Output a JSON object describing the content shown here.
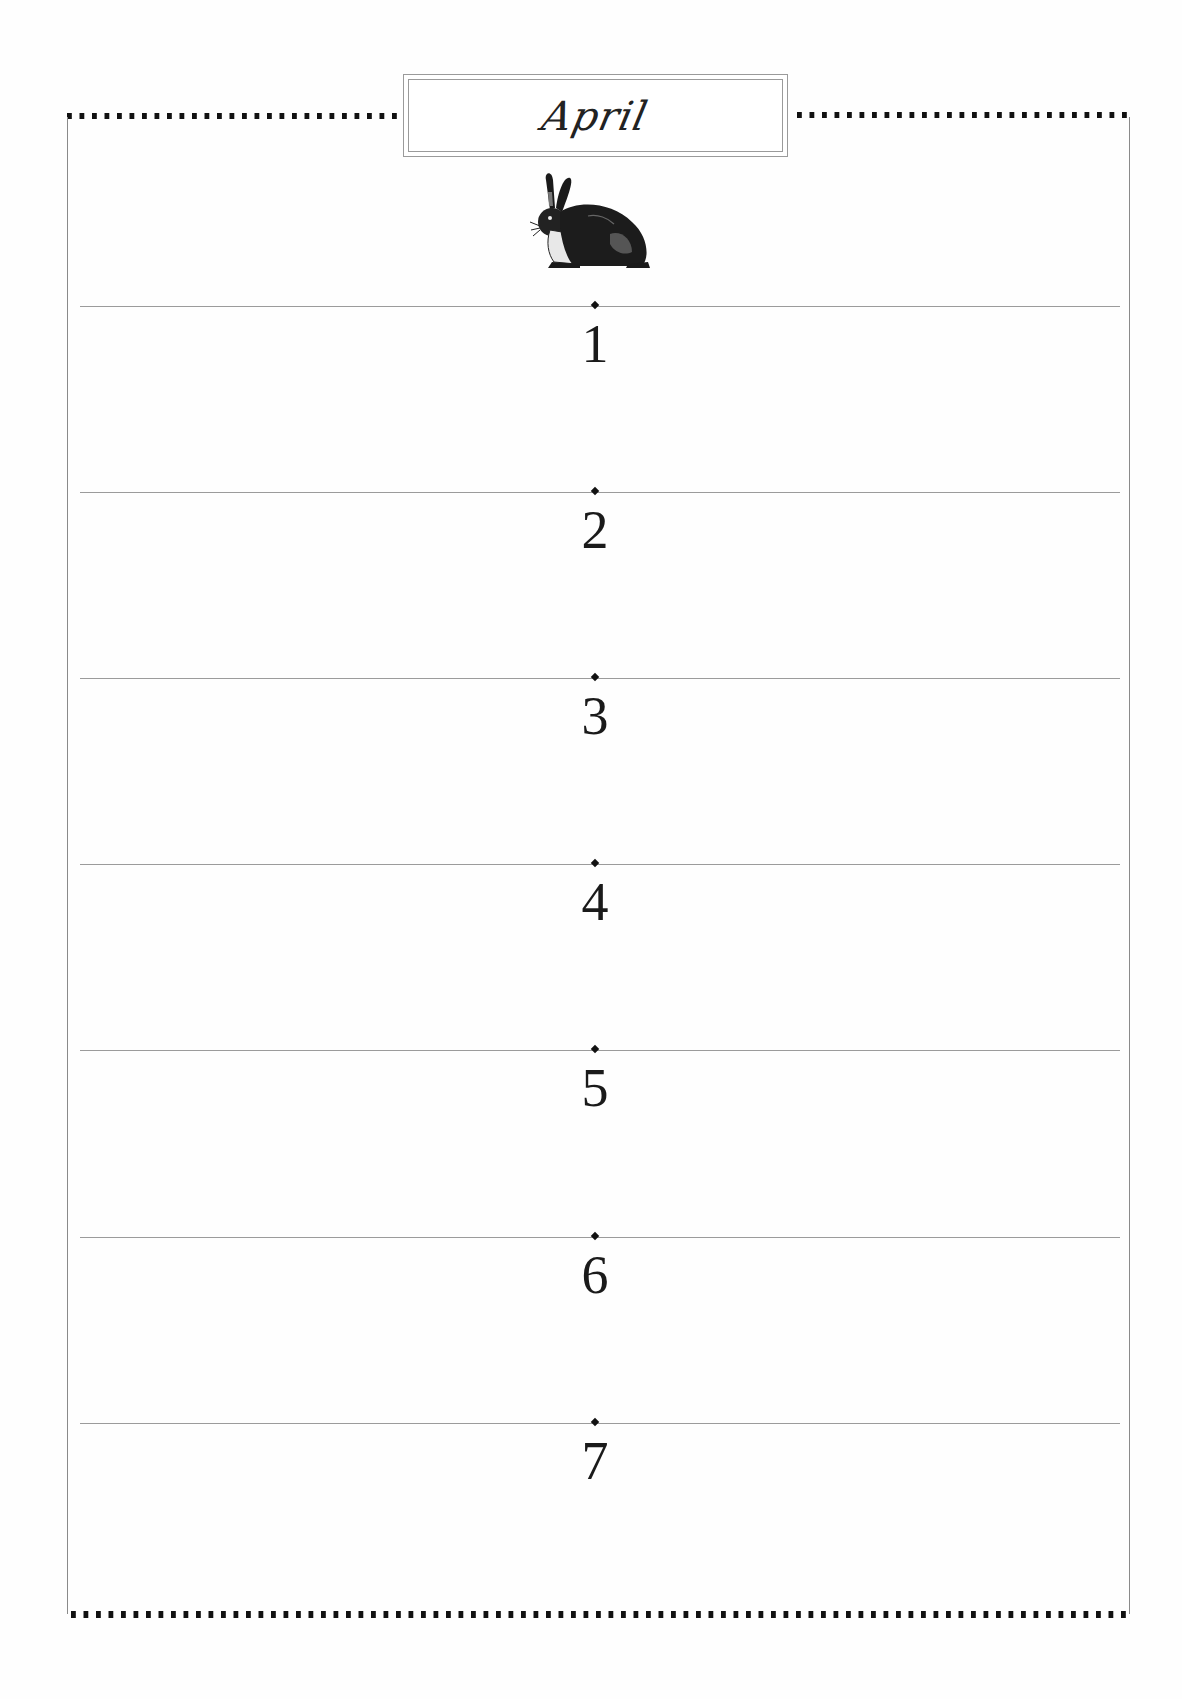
{
  "header": {
    "month": "April",
    "illustration": "rabbit-icon"
  },
  "days": [
    {
      "number": "1"
    },
    {
      "number": "2"
    },
    {
      "number": "3"
    },
    {
      "number": "4"
    },
    {
      "number": "5"
    },
    {
      "number": "6"
    },
    {
      "number": "7"
    }
  ],
  "colors": {
    "ink": "#111111",
    "rule": "#9b9b9b",
    "paper": "#fefefe"
  }
}
